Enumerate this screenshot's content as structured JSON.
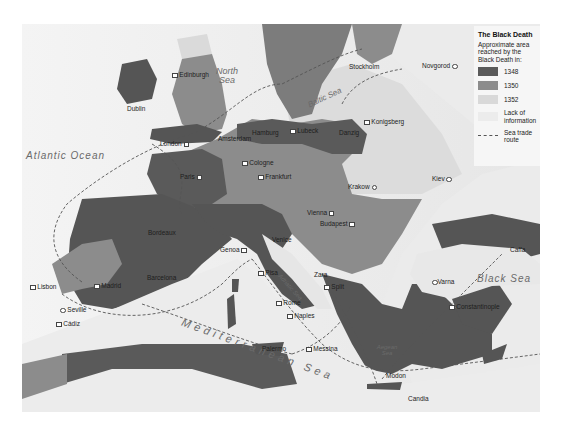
{
  "legend": {
    "title": "The Black Death",
    "description": "Approximate area reached by the Black Death in:",
    "items": [
      {
        "label": "1348",
        "color": "#5a5a5a"
      },
      {
        "label": "1350",
        "color": "#8c8c8c"
      },
      {
        "label": "1352",
        "color": "#d9d9d9"
      },
      {
        "label": "Lack of information",
        "color": "#ececec"
      },
      {
        "label": "Sea trade route",
        "style": "dashed"
      }
    ]
  },
  "seas": {
    "atlantic": "Atlantic Ocean",
    "north": "North Sea",
    "baltic": "Baltic Sea",
    "black": "Black Sea",
    "mediterranean": "Mediterranean Sea",
    "adriatic": "Adriatic Sea",
    "aegean": "Aegean Sea"
  },
  "cities": {
    "edinburgh": "Edinburgh",
    "dublin": "Dublin",
    "london": "London",
    "amsterdam": "Amsterdam",
    "hamburg": "Hamburg",
    "lubeck": "Lubeck",
    "danzig": "Danzig",
    "konigsberg": "Konigsberg",
    "stockholm": "Stockholm",
    "novgorod": "Novgorod",
    "cologne": "Cologne",
    "frankfurt": "Frankfurt",
    "paris": "Paris",
    "krakow": "Krakow",
    "kiev": "Kiev",
    "vienna": "Vienna",
    "budapest": "Budapest",
    "bordeaux": "Bordeaux",
    "genoa": "Genoa",
    "venice": "Venice",
    "pisa": "Pisa",
    "zara": "Zara",
    "split": "Split",
    "caffa": "Caffa",
    "lisbon": "Lisbon",
    "madrid": "Madrid",
    "barcelona": "Barcelona",
    "rome": "Rome",
    "varna": "Varna",
    "constantinople": "Constantinople",
    "seville": "Seville",
    "cadiz": "Cádiz",
    "naples": "Naples",
    "palermo": "Palermo",
    "messina": "Messina",
    "modon": "Modon",
    "candia": "Candia"
  }
}
